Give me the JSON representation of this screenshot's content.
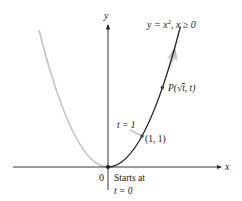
{
  "diagram": {
    "colors": {
      "axis": "#222222",
      "curve_active": "#2b2b2b",
      "curve_ghost": "#c4c4c4",
      "point": "#444444",
      "arrow": "#9a9a9a",
      "text": "#222222"
    },
    "axes": {
      "x_label": "x",
      "y_label": "y",
      "origin_label": "0"
    },
    "curve_label": {
      "lhs": "y = x",
      "exp": "2",
      "rhs": ", x ≥ 0"
    },
    "points": [
      {
        "name": "P",
        "label_prefix": "P(",
        "label_sqrt": "√",
        "label_t": "t",
        "label_suffix": ", t)",
        "x": 1.6,
        "y": 2.56
      },
      {
        "name": "unit-point",
        "label": "(1, 1)",
        "x": 1,
        "y": 1,
        "annotation": "t = 1"
      },
      {
        "name": "origin",
        "x": 0,
        "y": 0,
        "annotation_line1": "Starts at",
        "annotation_line2": "t = 0"
      }
    ]
  }
}
